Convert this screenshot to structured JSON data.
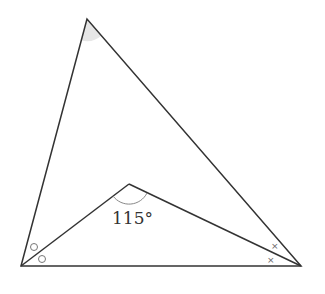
{
  "diagram": {
    "type": "geometry",
    "points": {
      "A": {
        "x": 87,
        "y": 19
      },
      "B": {
        "x": 21,
        "y": 266
      },
      "C": {
        "x": 301,
        "y": 266
      },
      "D": {
        "x": 129,
        "y": 184
      }
    },
    "angle_label": "115°",
    "marks": {
      "circle": "o",
      "cross": "×"
    },
    "colors": {
      "line": "#333333",
      "shade": "#e6e6e6",
      "arc": "#888888"
    }
  }
}
